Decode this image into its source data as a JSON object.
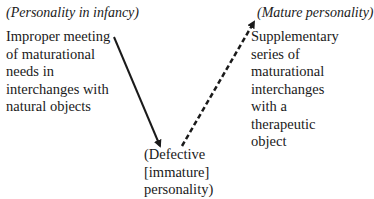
{
  "diagram": {
    "start_label": "(Personality in infancy)",
    "start_description": "Improper meeting\nof maturational\nneeds in\ninterchanges with\nnatural objects",
    "end_label": "(Mature personality)",
    "end_description": "Supplementary\nseries of\nmaturational\ninterchanges\nwith a\ntherapeutic\nobject",
    "bottom_label": "(Defective\n[immature]\npersonality)",
    "arrows": [
      {
        "name": "solid-arrow",
        "style": "solid",
        "from": [
          114,
          37
        ],
        "to": [
          161,
          148
        ]
      },
      {
        "name": "dashed-arrow",
        "style": "dashed",
        "from": [
          182,
          146
        ],
        "to": [
          255,
          20
        ]
      }
    ],
    "colors": {
      "ink": "#1a1a1a",
      "background": "#ffffff"
    }
  }
}
